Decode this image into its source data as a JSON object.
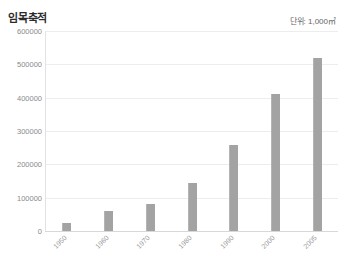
{
  "header": {
    "title": "임목축적",
    "unit": "단위: 1,000㎥"
  },
  "chart_data": {
    "type": "bar",
    "title": "임목축적",
    "subtitle": "단위: 1,000㎥",
    "xlabel": "",
    "ylabel": "",
    "unit": "1,000㎥",
    "categories": [
      "1950",
      "1960",
      "1970",
      "1980",
      "1990",
      "2000",
      "2005"
    ],
    "values": [
      24000,
      60000,
      82000,
      145000,
      257000,
      411000,
      518000
    ],
    "ylim": [
      0,
      600000
    ],
    "ytick_values": [
      0,
      100000,
      200000,
      300000,
      400000,
      500000,
      600000
    ],
    "ytick_labels": [
      "0",
      "100000",
      "200000",
      "300000",
      "400000",
      "500000",
      "600000"
    ],
    "grid": true,
    "legend": false,
    "bar_color": "#a3a3a3",
    "grid_color": "#ededed",
    "axis_color": "#d8d8d8",
    "tick_label_color": "#8a8a8a",
    "xtick_rotation": -45
  }
}
